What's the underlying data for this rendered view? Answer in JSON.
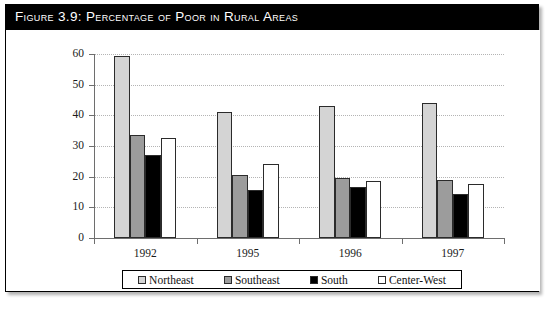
{
  "figure": {
    "title": "Figure 3.9:  Percentage of Poor in Rural Areas"
  },
  "chart_data": {
    "type": "bar",
    "title": "Figure 3.9:  Percentage of Poor in Rural Areas",
    "xlabel": "",
    "ylabel": "",
    "ylim": [
      0,
      60
    ],
    "yticks": [
      0,
      10,
      20,
      30,
      40,
      50,
      60
    ],
    "ytick_labels": [
      "0",
      "10",
      "20",
      "30",
      "40",
      "50",
      "60"
    ],
    "grid": true,
    "legend_position": "bottom",
    "categories": [
      "1992",
      "1995",
      "1996",
      "1997"
    ],
    "series": [
      {
        "name": "Northeast",
        "color": "#d4d4d4",
        "values": [
          59.5,
          41.0,
          43.0,
          44.0
        ]
      },
      {
        "name": "Southeast",
        "color": "#9c9c9c",
        "values": [
          33.5,
          20.5,
          19.5,
          19.0
        ]
      },
      {
        "name": "South",
        "color": "#000000",
        "values": [
          27.0,
          15.5,
          16.5,
          14.5
        ]
      },
      {
        "name": "Center-West",
        "color": "#ffffff",
        "values": [
          32.5,
          24.0,
          18.5,
          17.5
        ]
      }
    ]
  }
}
